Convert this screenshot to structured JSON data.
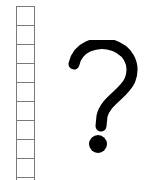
{
  "grid": {
    "cell_count": 10,
    "border_color": "#7a7a7a"
  },
  "symbol": {
    "glyph": "?",
    "name": "question-mark",
    "color": "#000000"
  }
}
